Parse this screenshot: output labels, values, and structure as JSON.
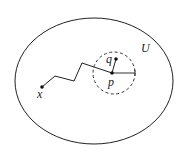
{
  "diagram": {
    "region_label": "U",
    "points": {
      "x": "x",
      "p": "p",
      "q": "q"
    },
    "stroke_color": "#222222",
    "background": "#ffffff"
  }
}
